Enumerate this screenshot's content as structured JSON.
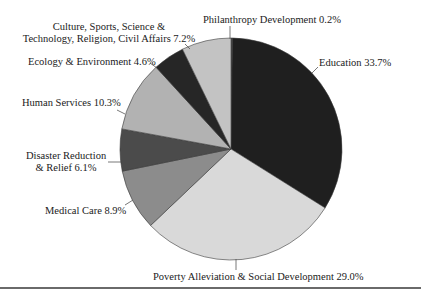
{
  "chart_data": {
    "type": "pie",
    "title": "",
    "start_angle_deg": 0,
    "direction": "clockwise",
    "center": [
      231,
      149
    ],
    "radius": 111,
    "slices": [
      {
        "key": "philanthropy",
        "label": "Philanthropy Development 0.2%",
        "name": "Philanthropy Development",
        "value": 0.2,
        "color": "#555555"
      },
      {
        "key": "education",
        "label": "Education 33.7%",
        "name": "Education",
        "value": 33.7,
        "color": "#1f1f1f"
      },
      {
        "key": "poverty",
        "label": "Poverty Alleviation & Social Development 29.0%",
        "name": "Poverty Alleviation & Social Development",
        "value": 29.0,
        "color": "#d9d9d9"
      },
      {
        "key": "medical",
        "label": "Medical Care 8.9%",
        "name": "Medical Care",
        "value": 8.9,
        "color": "#8c8c8c"
      },
      {
        "key": "disaster",
        "label": "Disaster Reduction & Relief 6.1%",
        "name": "Disaster Reduction & Relief",
        "value": 6.1,
        "color": "#4b4b4b"
      },
      {
        "key": "human",
        "label": "Human Services 10.3%",
        "name": "Human Services",
        "value": 10.3,
        "color": "#b2b2b2"
      },
      {
        "key": "ecology",
        "label": "Ecology & Environment 4.6%",
        "name": "Ecology & Environment",
        "value": 4.6,
        "color": "#262626"
      },
      {
        "key": "culture",
        "label": "Culture, Sports, Science & Technology, Religion, Civil Affairs 7.2%",
        "name": "Culture, Sports, Science & Technology, Religion, Civil Affairs",
        "value": 7.2,
        "color": "#c3c3c3"
      }
    ],
    "categories": [
      "Philanthropy Development",
      "Education",
      "Poverty Alleviation & Social Development",
      "Medical Care",
      "Disaster Reduction & Relief",
      "Human Services",
      "Ecology & Environment",
      "Culture, Sports, Science & Technology, Religion, Civil Affairs"
    ],
    "values": [
      0.2,
      33.7,
      29.0,
      8.9,
      6.1,
      10.3,
      4.6,
      7.2
    ],
    "legend": "none (direct labels with leader lines)"
  },
  "labels": {
    "philanthropy": "Philanthropy Development 0.2%",
    "education": "Education 33.7%",
    "poverty": "Poverty Alleviation & Social Development 29.0%",
    "medical": "Medical Care 8.9%",
    "disaster_line1": "Disaster Reduction",
    "disaster_line2": "& Relief 6.1%",
    "human": "Human Services 10.3%",
    "ecology": "Ecology & Environment 4.6%",
    "culture_line1": "Culture, Sports, Science &",
    "culture_line2": "Technology, Religion, Civil Affairs 7.2%"
  }
}
